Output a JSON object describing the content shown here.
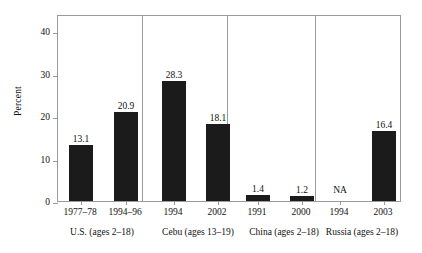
{
  "chart_data": {
    "type": "bar",
    "title": "",
    "subtitle": "",
    "xlabel": "",
    "ylabel": "Percent",
    "ylim": [
      0,
      44
    ],
    "grid": false,
    "legend": "none",
    "yticks": [
      "0",
      "10",
      "20",
      "30",
      "40"
    ],
    "ytick_values": [
      0,
      10,
      20,
      30,
      40
    ],
    "categories": [
      "1977–78",
      "1994–96",
      "1994",
      "2002",
      "1991",
      "2000",
      "1994",
      "2003"
    ],
    "values": [
      13.1,
      20.9,
      28.3,
      18.1,
      1.4,
      1.2,
      null,
      16.4
    ],
    "value_labels": [
      "13.1",
      "20.9",
      "28.3",
      "18.1",
      "1.4",
      "1.2",
      "NA",
      "16.4"
    ],
    "groups": [
      {
        "label": "U.S. (ages 2–18)",
        "categories": [
          "1977–78",
          "1994–96"
        ],
        "values": [
          13.1,
          20.9
        ],
        "value_labels": [
          "13.1",
          "20.9"
        ]
      },
      {
        "label": "Cebu (ages 13–19)",
        "categories": [
          "1994",
          "2002"
        ],
        "values": [
          28.3,
          18.1
        ],
        "value_labels": [
          "28.3",
          "18.1"
        ]
      },
      {
        "label": "China (ages 2–18)",
        "categories": [
          "1991",
          "2000"
        ],
        "values": [
          1.4,
          1.2
        ],
        "value_labels": [
          "1.4",
          "1.2"
        ]
      },
      {
        "label": "Russia (ages 2–18)",
        "categories": [
          "1994",
          "2003"
        ],
        "values": [
          null,
          16.4
        ],
        "value_labels": [
          "NA",
          "16.4"
        ]
      }
    ],
    "bar_color": "#1b1b1b",
    "axis_color": "#9a9a9a",
    "background": "#ffffff"
  },
  "bars": [
    {
      "label": "13.1",
      "left": 11,
      "width": 24,
      "pct": 13.1
    },
    {
      "label": "20.9",
      "left": 56,
      "width": 24,
      "pct": 20.9
    },
    {
      "label": "28.3",
      "left": 104,
      "width": 24,
      "pct": 28.3
    },
    {
      "label": "18.1",
      "left": 148,
      "width": 24,
      "pct": 18.1
    },
    {
      "label": "1.4",
      "left": 188,
      "width": 24,
      "pct": 1.4
    },
    {
      "label": "1.2",
      "left": 232,
      "width": 24,
      "pct": 1.2
    },
    {
      "label": "16.4",
      "left": 314,
      "width": 24,
      "pct": 16.4
    }
  ],
  "na": {
    "label": "NA"
  },
  "yticks": [
    {
      "label": "40",
      "pct": 40
    },
    {
      "label": "30",
      "pct": 30
    },
    {
      "label": "20",
      "pct": 20
    },
    {
      "label": "10",
      "pct": 10
    },
    {
      "label": "0",
      "pct": 0
    }
  ],
  "xticks": [
    {
      "label": "1977–78",
      "center": 23
    },
    {
      "label": "1994–96",
      "center": 68
    },
    {
      "label": "1994",
      "center": 116
    },
    {
      "label": "2002",
      "center": 160
    },
    {
      "label": "1991",
      "center": 200
    },
    {
      "label": "2000",
      "center": 244
    },
    {
      "label": "1994",
      "center": 282
    },
    {
      "label": "2003",
      "center": 326
    }
  ],
  "groupLabels": [
    {
      "label": "U.S. (ages 2–18)",
      "center": 45
    },
    {
      "label": "Cebu (ages 13–19)",
      "center": 141
    },
    {
      "label": "China (ages 2–18)",
      "center": 227
    },
    {
      "label": "Russia (ages 2–18)",
      "center": 305
    }
  ],
  "separators": [
    84,
    169,
    257
  ],
  "axis": {
    "ylabel": "Percent"
  }
}
